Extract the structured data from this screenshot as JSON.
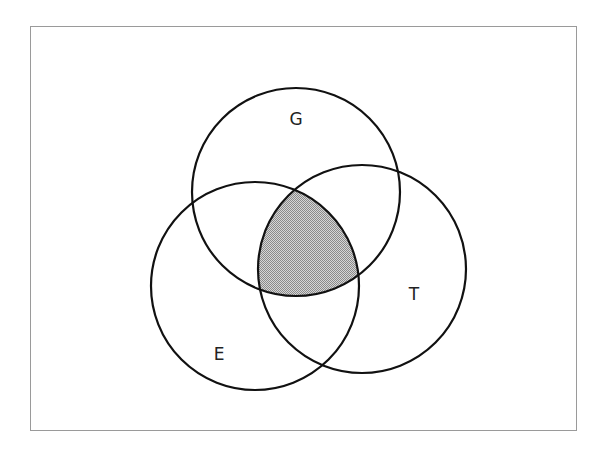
{
  "diagram": {
    "type": "venn-3-set",
    "sets": [
      {
        "label": "G",
        "cx": 296,
        "cy": 192,
        "r": 104,
        "label_x": 296,
        "label_y": 125
      },
      {
        "label": "E",
        "cx": 255,
        "cy": 286,
        "r": 104,
        "label_x": 219,
        "label_y": 360
      },
      {
        "label": "T",
        "cx": 362,
        "cy": 269,
        "r": 104,
        "label_x": 414,
        "label_y": 300
      }
    ],
    "shaded_region": {
      "description": "G ∩ E ∩ T",
      "fill": "#bdbdbd"
    },
    "stroke_color": "#111111",
    "frame_color": "#9a9a9a"
  }
}
